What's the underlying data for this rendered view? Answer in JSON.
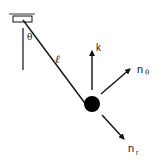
{
  "diagram": {
    "type": "pendulum-free-body",
    "labels": {
      "theta": "θ",
      "length": "ℓ",
      "k": "k",
      "n_theta_base": "n",
      "n_theta_sub": "θ",
      "n_r_base": "n",
      "n_r_sub": "r"
    },
    "colors": {
      "stroke": "#111111",
      "mass": "#000000",
      "ceiling": "#999999"
    }
  }
}
